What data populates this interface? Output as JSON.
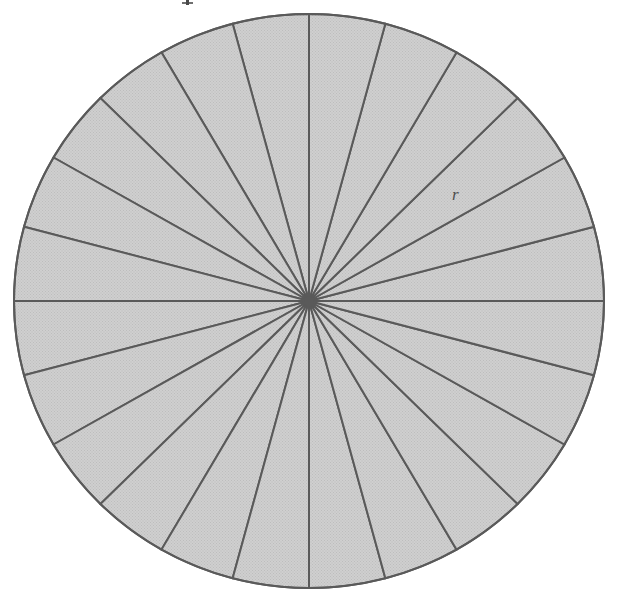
{
  "figure": {
    "caption": "",
    "background_color": "#ffffff",
    "annotations": [
      {
        "name": "radius-label",
        "text": "r",
        "style": "italic",
        "x": 458,
        "y": 199,
        "color": "#4f4f4f",
        "describes": "radius of the circle"
      }
    ],
    "artifacts": [
      {
        "name": "top-glyph-artifact",
        "text": "",
        "description": "cropped glyph fragment from the text line above the figure",
        "x": 186,
        "y": 2
      }
    ]
  },
  "chart_data": {
    "type": "pie",
    "subtitle": "",
    "xlabel": "",
    "ylabel": "",
    "legend_position": "none",
    "grid": false,
    "sector_count": 24,
    "sector_angle_degrees": 15,
    "equal_slices": true,
    "start_angle_degrees": 90,
    "categories": [
      "sector 1",
      "sector 2",
      "sector 3",
      "sector 4",
      "sector 5",
      "sector 6",
      "sector 7",
      "sector 8",
      "sector 9",
      "sector 10",
      "sector 11",
      "sector 12",
      "sector 13",
      "sector 14",
      "sector 15",
      "sector 16",
      "sector 17",
      "sector 18",
      "sector 19",
      "sector 20",
      "sector 21",
      "sector 22",
      "sector 23",
      "sector 24"
    ],
    "values": [
      15,
      15,
      15,
      15,
      15,
      15,
      15,
      15,
      15,
      15,
      15,
      15,
      15,
      15,
      15,
      15,
      15,
      15,
      15,
      15,
      15,
      15,
      15,
      15
    ],
    "geometry": {
      "center_x": 309,
      "center_y": 301,
      "radius_x": 295,
      "radius_y": 287,
      "bounds": {
        "left": 14,
        "top": 14,
        "right": 604,
        "bottom": 588
      }
    },
    "style": {
      "fill_color": "#c9c9c9",
      "fill_texture": "halftone-dots",
      "stroke_color": "#5a5a5a",
      "stroke_width": 2,
      "outline_color": "#5a5a5a",
      "hub_color": "#5a5a5a",
      "hub_radius": 5
    },
    "annotations": [
      {
        "label": "r",
        "type": "radius",
        "angle_degrees": 22.5
      }
    ]
  }
}
